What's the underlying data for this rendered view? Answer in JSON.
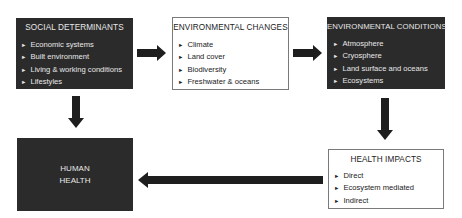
{
  "diagram": {
    "nodes": {
      "social_determinants": {
        "title": "SOCIAL DETERMINANTS",
        "items": [
          "Economic systems",
          "Built environment",
          "Living & working conditions",
          "Lifestyles"
        ]
      },
      "environmental_changes": {
        "title": "ENVIRONMENTAL CHANGES",
        "items": [
          "Climate",
          "Land cover",
          "Biodiversity",
          "Freshwater & oceans"
        ]
      },
      "environmental_conditions": {
        "title": "ENVIRONMENTAL CONDITIONS",
        "items": [
          "Atmosphere",
          "Cryosphere",
          "Land surface and oceans",
          "Ecosystems"
        ]
      },
      "human_health": {
        "title_line1": "HUMAN",
        "title_line2": "HEALTH"
      },
      "health_impacts": {
        "title": "HEALTH IMPACTS",
        "items": [
          "Direct",
          "Ecosystem mediated",
          "Indirect"
        ]
      }
    },
    "bullet_glyph": "►",
    "edges": [
      {
        "from": "SOCIAL DETERMINANTS",
        "to": "ENVIRONMENTAL CHANGES"
      },
      {
        "from": "ENVIRONMENTAL CHANGES",
        "to": "ENVIRONMENTAL CONDITIONS"
      },
      {
        "from": "ENVIRONMENTAL CONDITIONS",
        "to": "HEALTH IMPACTS"
      },
      {
        "from": "HEALTH IMPACTS",
        "to": "HUMAN HEALTH"
      },
      {
        "from": "SOCIAL DETERMINANTS",
        "to": "HUMAN HEALTH"
      }
    ],
    "colors": {
      "dark_box": "#2b2b2b",
      "dark_text": "#e8e8e8",
      "light_border": "#7a7a7a",
      "arrow": "#1e1e1e"
    }
  }
}
